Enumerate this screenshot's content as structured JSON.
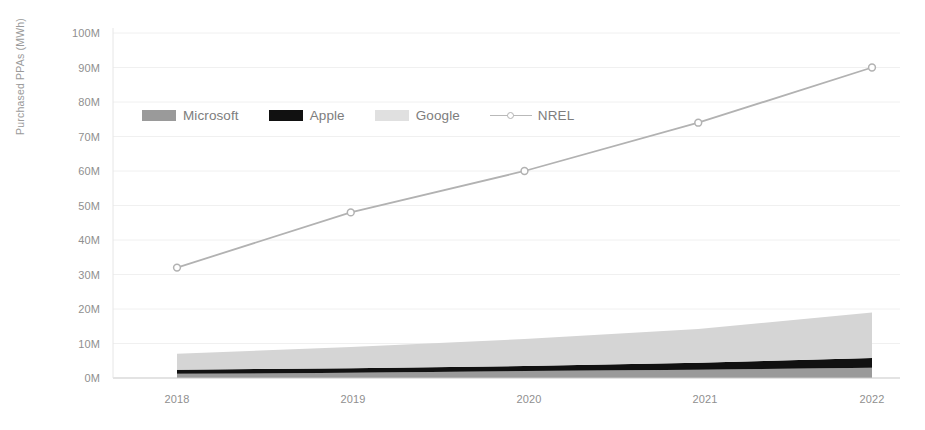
{
  "chart_data": {
    "type": "area",
    "title": "",
    "subtitle": "",
    "xlabel": "",
    "ylabel": "Purchased PPAs (MWh)",
    "categories": [
      "2018",
      "2019",
      "2020",
      "2021",
      "2022"
    ],
    "x": [
      2018,
      2019,
      2020,
      2021,
      2022
    ],
    "ylim": [
      0,
      100
    ],
    "ytick_labels": [
      "0M",
      "10M",
      "20M",
      "30M",
      "40M",
      "50M",
      "60M",
      "70M",
      "80M",
      "90M",
      "100M"
    ],
    "ytick_values": [
      0,
      10,
      20,
      30,
      40,
      50,
      60,
      70,
      80,
      90,
      100
    ],
    "units": "millions of MWh",
    "grid": true,
    "grid_axis": "y",
    "legend_position": "upper-left-inside",
    "stacked": true,
    "series": [
      {
        "name": "Microsoft",
        "type": "area",
        "stack": true,
        "color": "#9a9a9a",
        "values": [
          1.2,
          1.5,
          2.0,
          2.4,
          3.0
        ]
      },
      {
        "name": "Apple",
        "type": "area",
        "stack": true,
        "color": "#111111",
        "values": [
          1.2,
          1.3,
          1.5,
          2.0,
          2.8
        ]
      },
      {
        "name": "Google",
        "type": "area",
        "stack": true,
        "color": "#d5d5d5",
        "values": [
          4.6,
          6.2,
          7.8,
          9.8,
          13.2
        ]
      },
      {
        "name": "NREL",
        "type": "line",
        "stack": false,
        "color": "#b2b2b2",
        "marker": "circle",
        "values": [
          32,
          48,
          60,
          74,
          90
        ]
      }
    ]
  },
  "legend": {
    "items": [
      {
        "label": "Microsoft",
        "icon": "legend-swatch-icon",
        "color": "#9a9a9a"
      },
      {
        "label": "Apple",
        "icon": "legend-swatch-icon",
        "color": "#111111"
      },
      {
        "label": "Google",
        "icon": "legend-swatch-icon",
        "color": "#d5d5d5"
      },
      {
        "label": "NREL",
        "icon": "legend-line-marker-icon",
        "color": "#b2b2b2"
      }
    ]
  },
  "axes": {
    "y": {
      "title": "Purchased PPAs (MWh)",
      "ticks": [
        "0M",
        "10M",
        "20M",
        "30M",
        "40M",
        "50M",
        "60M",
        "70M",
        "80M",
        "90M",
        "100M"
      ]
    },
    "x": {
      "title": "",
      "ticks": [
        "2018",
        "2019",
        "2020",
        "2021",
        "2022"
      ]
    }
  },
  "colors": {
    "background": "#ffffff",
    "grid": "#efefef",
    "axis_line": "#cfcfcf",
    "text": "#8f8f8f",
    "microsoft": "#9a9a9a",
    "apple": "#111111",
    "google": "#d5d5d5",
    "nrel": "#b2b2b2"
  }
}
